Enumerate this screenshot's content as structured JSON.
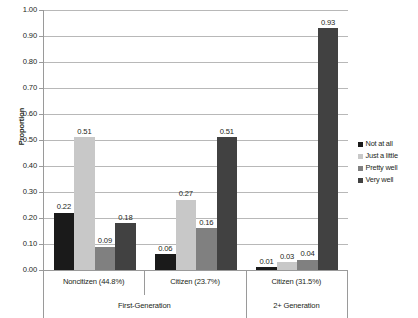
{
  "chart_data": {
    "type": "bar",
    "title": "",
    "xlabel": "",
    "ylabel": "Proportion",
    "ylim": [
      0,
      1.0
    ],
    "ytick_step": 0.1,
    "grid": true,
    "legend_position": "right",
    "categories": [
      "Noncitizen (44.8%)",
      "Citizen (23.7%)",
      "Citizen (31.5%)"
    ],
    "group_labels": [
      "First-Generation",
      "2+ Generation"
    ],
    "group_spans": [
      2,
      1
    ],
    "series": [
      {
        "name": "Not at all",
        "color": "#1a1a1a",
        "values": [
          0.22,
          0.06,
          0.01
        ]
      },
      {
        "name": "Just a little",
        "color": "#c8c8c8",
        "values": [
          0.51,
          0.27,
          0.03
        ]
      },
      {
        "name": "Pretty well",
        "color": "#808080",
        "values": [
          0.09,
          0.16,
          0.04
        ]
      },
      {
        "name": "Very well",
        "color": "#414141",
        "values": [
          0.18,
          0.51,
          0.93
        ]
      }
    ],
    "ytick_labels": [
      "0.00",
      "0.10",
      "0.20",
      "0.30",
      "0.40",
      "0.50",
      "0.60",
      "0.70",
      "0.80",
      "0.90",
      "1.00"
    ],
    "value_labels": [
      [
        "0.22",
        "0.51",
        "0.09",
        "0.18"
      ],
      [
        "0.06",
        "0.27",
        "0.16",
        "0.51"
      ],
      [
        "0.01",
        "0.03",
        "0.04",
        "0.93"
      ]
    ]
  }
}
